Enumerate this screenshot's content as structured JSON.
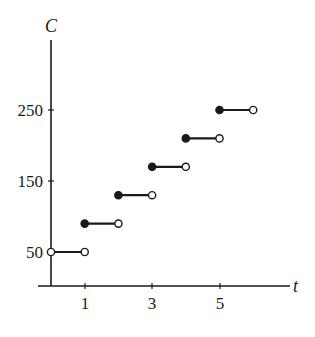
{
  "chart_data": {
    "type": "line",
    "subtype": "step",
    "title": "",
    "xlabel": "t",
    "ylabel": "C",
    "x_ticks": [
      1,
      3,
      5
    ],
    "y_ticks": [
      50,
      150,
      250
    ],
    "xlim": [
      0,
      6
    ],
    "ylim": [
      0,
      250
    ],
    "grid": false,
    "legend": null,
    "segments": [
      {
        "x_start": 0,
        "x_end": 1,
        "y": 50,
        "start": "open",
        "end": "open"
      },
      {
        "x_start": 1,
        "x_end": 2,
        "y": 90,
        "start": "closed",
        "end": "open"
      },
      {
        "x_start": 2,
        "x_end": 3,
        "y": 130,
        "start": "closed",
        "end": "open"
      },
      {
        "x_start": 3,
        "x_end": 4,
        "y": 170,
        "start": "closed",
        "end": "open"
      },
      {
        "x_start": 4,
        "x_end": 5,
        "y": 210,
        "start": "closed",
        "end": "open"
      },
      {
        "x_start": 5,
        "x_end": 6,
        "y": 250,
        "start": "closed",
        "end": "open"
      }
    ]
  },
  "labels": {
    "x_axis": "t",
    "y_axis": "C",
    "x_tick_1": "1",
    "x_tick_3": "3",
    "x_tick_5": "5",
    "y_tick_50": "50",
    "y_tick_150": "150",
    "y_tick_250": "250"
  },
  "colors": {
    "ink": "#1a1a1a",
    "background": "#ffffff"
  }
}
